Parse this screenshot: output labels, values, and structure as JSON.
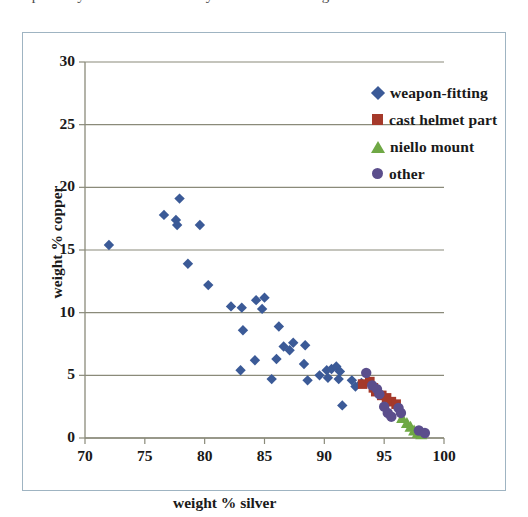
{
  "page": {
    "top_text_sliver": "the partially visible line of body text above the figure"
  },
  "figure": {
    "border_color": "#9fb4c2",
    "background": "#ffffff"
  },
  "legend": {
    "position": "top-right-inside",
    "items": [
      {
        "label": "weapon-fitting",
        "marker": "diamond",
        "color": "#3b5a97",
        "icon": "diamond-marker-icon"
      },
      {
        "label": "cast helmet part",
        "marker": "square",
        "color": "#a5392a",
        "icon": "square-marker-icon"
      },
      {
        "label": "niello mount",
        "marker": "triangle",
        "color": "#6fa845",
        "icon": "triangle-marker-icon"
      },
      {
        "label": "other",
        "marker": "circle",
        "color": "#5b4e8c",
        "icon": "circle-marker-icon"
      }
    ]
  },
  "chart_data": {
    "type": "scatter",
    "title": "",
    "xlabel": "weight % silver",
    "ylabel": "weight % copper",
    "xlim": [
      70,
      100
    ],
    "ylim": [
      0,
      30
    ],
    "xticks": [
      70,
      75,
      80,
      85,
      90,
      95,
      100
    ],
    "yticks": [
      0,
      5,
      10,
      15,
      20,
      25,
      30
    ],
    "grid": "horizontal",
    "grid_color": "#8a8a7a",
    "legend_position": "upper right",
    "series": [
      {
        "name": "weapon-fitting",
        "marker": "diamond",
        "color": "#3b5a97",
        "points": [
          [
            72.0,
            15.4
          ],
          [
            76.6,
            17.8
          ],
          [
            77.9,
            19.1
          ],
          [
            77.6,
            17.4
          ],
          [
            77.7,
            17.0
          ],
          [
            79.6,
            17.0
          ],
          [
            78.6,
            13.9
          ],
          [
            80.3,
            12.2
          ],
          [
            82.2,
            10.5
          ],
          [
            83.1,
            10.4
          ],
          [
            84.3,
            11.0
          ],
          [
            85.0,
            11.2
          ],
          [
            84.8,
            10.3
          ],
          [
            83.2,
            8.6
          ],
          [
            83.0,
            5.4
          ],
          [
            84.2,
            6.2
          ],
          [
            86.2,
            8.9
          ],
          [
            86.6,
            7.3
          ],
          [
            87.1,
            7.0
          ],
          [
            87.4,
            7.6
          ],
          [
            88.4,
            7.4
          ],
          [
            86.0,
            6.3
          ],
          [
            85.6,
            4.7
          ],
          [
            88.3,
            5.9
          ],
          [
            88.6,
            4.6
          ],
          [
            89.6,
            5.0
          ],
          [
            90.2,
            5.4
          ],
          [
            90.6,
            5.5
          ],
          [
            90.3,
            4.8
          ],
          [
            91.0,
            5.7
          ],
          [
            91.3,
            5.3
          ],
          [
            91.2,
            4.7
          ],
          [
            91.5,
            2.6
          ],
          [
            92.3,
            4.6
          ],
          [
            92.6,
            4.1
          ],
          [
            93.1,
            4.4
          ]
        ]
      },
      {
        "name": "cast helmet part",
        "marker": "square",
        "color": "#a5392a",
        "points": [
          [
            93.2,
            4.3
          ],
          [
            93.8,
            4.5
          ],
          [
            94.1,
            4.0
          ],
          [
            94.3,
            3.7
          ],
          [
            94.8,
            3.4
          ],
          [
            95.2,
            3.2
          ],
          [
            95.6,
            2.9
          ],
          [
            96.0,
            2.7
          ]
        ]
      },
      {
        "name": "niello mount",
        "marker": "triangle",
        "color": "#6fa845",
        "points": [
          [
            96.5,
            1.6
          ],
          [
            96.9,
            1.2
          ],
          [
            97.2,
            0.9
          ],
          [
            97.5,
            0.6
          ],
          [
            97.8,
            0.4
          ],
          [
            98.1,
            0.3
          ]
        ]
      },
      {
        "name": "other",
        "marker": "circle",
        "color": "#5b4e8c",
        "points": [
          [
            93.5,
            5.2
          ],
          [
            94.0,
            4.2
          ],
          [
            94.4,
            3.9
          ],
          [
            94.6,
            3.5
          ],
          [
            95.0,
            2.5
          ],
          [
            95.3,
            2.0
          ],
          [
            95.6,
            1.7
          ],
          [
            96.2,
            2.4
          ],
          [
            96.4,
            2.0
          ],
          [
            97.9,
            0.6
          ],
          [
            98.4,
            0.4
          ]
        ]
      }
    ]
  }
}
